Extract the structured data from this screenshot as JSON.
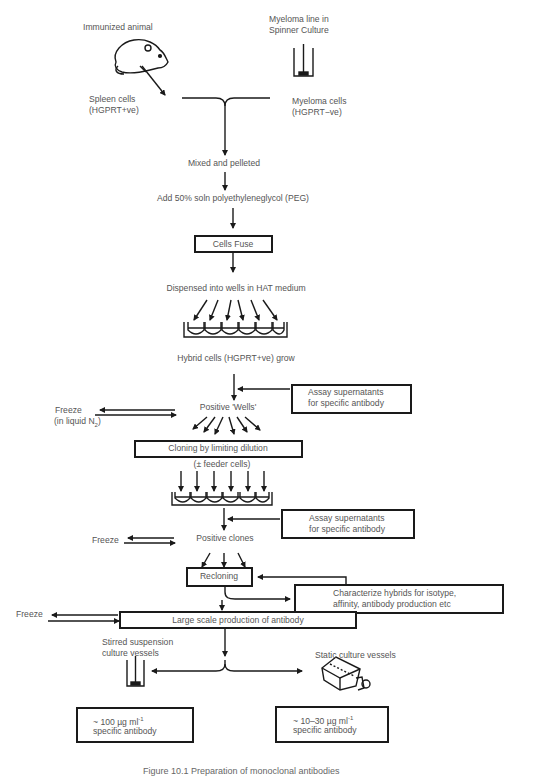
{
  "diagram": {
    "type": "flowchart",
    "inputs": {
      "animal": {
        "label": "Immunized animal",
        "icon": "mouse-icon"
      },
      "myeloma_source": {
        "label_line1": "Myeloma line in",
        "label_line2": "Spinner Culture",
        "icon": "spinner-flask-icon"
      },
      "spleen": {
        "line1": "Spleen cells",
        "line2": "(HGPRT+ve)"
      },
      "myeloma": {
        "line1": "Myeloma cells",
        "line2": "(HGPRT−ve)"
      }
    },
    "steps": {
      "mixed": "Mixed and pelleted",
      "peg": "Add 50% soln polyethyleneglycol (PEG)",
      "fuse": "Cells   Fuse",
      "dispensed": "Dispensed into wells in HAT medium",
      "hybrid": "Hybrid cells (HGPRT+ve)  grow",
      "positive_wells": "Positive 'Wells'",
      "cloning": "Cloning by limiting dilution",
      "feeder": "(± feeder cells)",
      "positive_clones": "Positive clones",
      "recloning": "Recloning",
      "large_scale": "Large scale production of antibody"
    },
    "side_boxes": {
      "assay1_line1": "Assay supernatants",
      "assay1_line2": "for specific antibody",
      "assay2_line1": "Assay supernatants",
      "assay2_line2": "for specific antibody",
      "characterize_line1": "Characterize hybrids for isotype,",
      "characterize_line2": "affinity, antibody production etc"
    },
    "freeze": {
      "f1_line1": "Freeze",
      "f1_line2": "(in liquid N",
      "f1_sub": "2",
      "f1_close": ")",
      "f2": "Freeze",
      "f3": "Freeze"
    },
    "outputs": {
      "stirred_line1": "Stirred suspension",
      "stirred_line2": "culture vessels",
      "static": "Static culture vessels",
      "yield_stirred_line1": "~ 100 µg ml",
      "yield_stirred_sup": "-1",
      "yield_stirred_line2": "specific antibody",
      "yield_static_line1": "~ 10–30 µg ml",
      "yield_static_sup": "-1",
      "yield_static_line2": "specific antibody"
    },
    "caption": "Figure 10.1   Preparation of monoclonal antibodies"
  }
}
